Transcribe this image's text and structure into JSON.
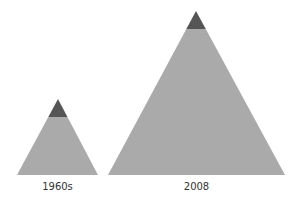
{
  "colors": {
    "body": "#aaaaaa",
    "tip": "#555555",
    "background": "#ffffff"
  },
  "pyramids": [
    {
      "label": "1960s",
      "apex": [
        58,
        99
      ],
      "tip_y": 117,
      "base_y": 175,
      "base_left": 17,
      "base_right": 98
    },
    {
      "label": "2008",
      "apex": [
        196,
        11
      ],
      "tip_y": 29,
      "base_y": 175,
      "base_left": 108,
      "base_right": 285
    }
  ]
}
